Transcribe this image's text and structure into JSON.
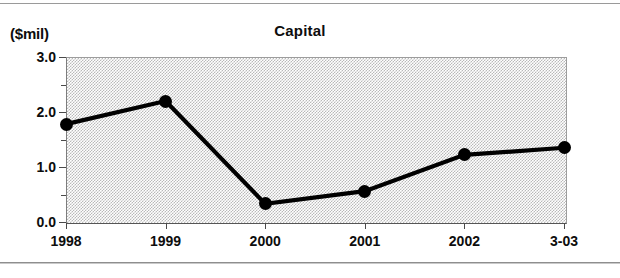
{
  "figure": {
    "unit_label": "($mil)",
    "title": "Capital"
  },
  "chart_data": {
    "type": "line",
    "title": "Capital",
    "xlabel": "",
    "ylabel": "($mil)",
    "categories": [
      "1998",
      "1999",
      "2000",
      "2001",
      "2002",
      "3-03"
    ],
    "values": [
      1.78,
      2.2,
      0.33,
      0.56,
      1.22,
      1.35
    ],
    "series": [
      {
        "name": "Capital",
        "values": [
          1.78,
          2.2,
          0.33,
          0.56,
          1.22,
          1.35
        ]
      }
    ],
    "ylim": [
      0.0,
      3.0
    ],
    "ytick_labels": [
      "0.0",
      "1.0",
      "2.0",
      "3.0"
    ],
    "ytick_values": [
      0.0,
      1.0,
      2.0,
      3.0
    ],
    "yminor_tick_values": [
      0.5,
      1.5,
      2.5
    ],
    "grid": false,
    "legend": "none",
    "marker": "filled-circle",
    "line_color": "#000000",
    "marker_color": "#000000",
    "plot_background": "#c0c0c0"
  }
}
